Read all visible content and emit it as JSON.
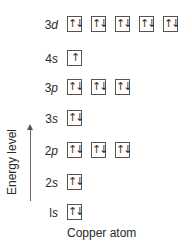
{
  "diagram": {
    "caption": "Copper atom",
    "axis_label": "Energy level",
    "orbitals": [
      {
        "name": "3d",
        "num": "3",
        "sub": "d",
        "top": 16,
        "boxes": [
          "↑↓",
          "↑↓",
          "↑↓",
          "↑↓",
          "↑↓"
        ]
      },
      {
        "name": "4s",
        "num": "4",
        "sub": "s",
        "top": 50,
        "boxes": [
          "↑"
        ]
      },
      {
        "name": "3p",
        "num": "3",
        "sub": "p",
        "top": 79,
        "boxes": [
          "↑↓",
          "↑↓",
          "↑↓"
        ]
      },
      {
        "name": "3s",
        "num": "3",
        "sub": "s",
        "top": 110,
        "boxes": [
          "↑↓"
        ]
      },
      {
        "name": "2p",
        "num": "2",
        "sub": "p",
        "top": 142,
        "boxes": [
          "↑↓",
          "↑↓",
          "↑↓"
        ]
      },
      {
        "name": "2s",
        "num": "2",
        "sub": "s",
        "top": 174,
        "boxes": [
          "↑↓"
        ]
      },
      {
        "name": "1s",
        "num": "l",
        "sub": "s",
        "top": 204,
        "boxes": [
          "↑↓"
        ]
      }
    ]
  }
}
